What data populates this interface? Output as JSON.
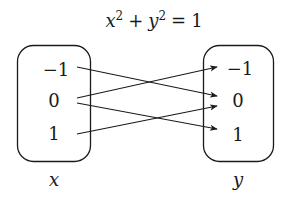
{
  "title": {
    "base_x": "x",
    "exp_x": "2",
    "plus": "+",
    "base_y": "y",
    "exp_y": "2",
    "equals": "=",
    "rhs": "1"
  },
  "domain_set": {
    "label": "x",
    "elements": [
      "−1",
      "0",
      "1"
    ]
  },
  "codomain_set": {
    "label": "y",
    "elements": [
      "−1",
      "0",
      "1"
    ]
  },
  "mappings": [
    {
      "from": "−1",
      "to": "0"
    },
    {
      "from": "0",
      "to": "−1"
    },
    {
      "from": "0",
      "to": "1"
    },
    {
      "from": "1",
      "to": "0"
    }
  ],
  "colors": {
    "stroke": "#1a1a1a",
    "background": "#ffffff"
  }
}
